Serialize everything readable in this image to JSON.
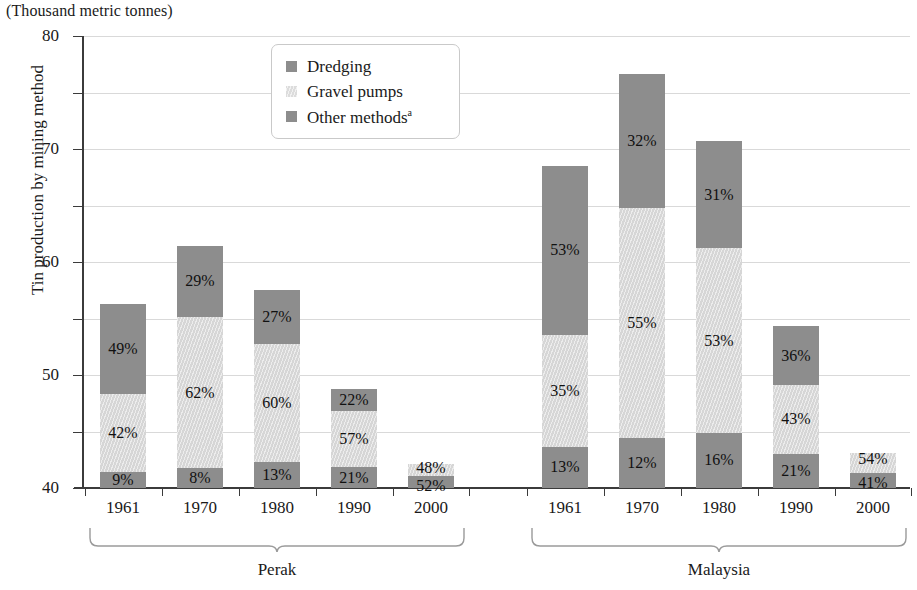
{
  "units_note": "(Thousand metric tonnes)",
  "axis": {
    "y_title": "Tin production by mining method",
    "y_ticks": [
      "0",
      "10",
      "20",
      "30",
      "40",
      "50",
      "60",
      "70",
      "80"
    ]
  },
  "legend": {
    "items": [
      {
        "label": "Dredging",
        "key": "dredging",
        "swatch_icon": "square-swatch-dark",
        "color": "#8d8d8d"
      },
      {
        "label": "Gravel pumps",
        "key": "gravel",
        "swatch_icon": "square-swatch-light-hatched",
        "color": "#dcdcdc"
      },
      {
        "label": "Other methods",
        "label_sup": "a",
        "key": "other",
        "swatch_icon": "square-swatch-medium",
        "color": "#8d8d8d"
      }
    ]
  },
  "groups": [
    {
      "name": "Perak",
      "label": "Perak"
    },
    {
      "name": "Malaysia",
      "label": "Malaysia"
    }
  ],
  "chart_data": {
    "type": "bar",
    "subtype": "stacked",
    "title": "",
    "subtitle": "(Thousand metric tonnes)",
    "xlabel": "",
    "ylabel": "Tin production by mining method",
    "ylim": [
      0,
      80
    ],
    "ytick_step": 10,
    "grid": "horizontal",
    "legend_position": "inside-top-center",
    "footnote_marker": "a",
    "series": [
      {
        "name": "Other methods",
        "key": "other",
        "color": "#8d8d8d",
        "stack_order": 0
      },
      {
        "name": "Gravel pumps",
        "key": "gravel",
        "color": "#dcdcdc",
        "stack_order": 1
      },
      {
        "name": "Dredging",
        "key": "dredging",
        "color": "#8d8d8d",
        "stack_order": 2
      }
    ],
    "groups": [
      {
        "group": "Perak",
        "categories": [
          "1961",
          "1970",
          "1980",
          "1990",
          "2000"
        ],
        "totals": [
          32.5,
          43.3,
          35.0,
          17.5,
          4.2
        ],
        "bars": [
          {
            "x": "1961",
            "total": 32.5,
            "segments": [
              {
                "key": "other",
                "pct": 9,
                "pct_label": "9%",
                "value": 2.9
              },
              {
                "key": "gravel",
                "pct": 42,
                "pct_label": "42%",
                "value": 13.7
              },
              {
                "key": "dredging",
                "pct": 49,
                "pct_label": "49%",
                "value": 15.9
              }
            ]
          },
          {
            "x": "1970",
            "total": 43.3,
            "segments": [
              {
                "key": "other",
                "pct": 8,
                "pct_label": "8%",
                "value": 3.5
              },
              {
                "key": "gravel",
                "pct": 62,
                "pct_label": "62%",
                "value": 26.8
              },
              {
                "key": "dredging",
                "pct": 29,
                "pct_label": "29%",
                "value": 12.6
              }
            ]
          },
          {
            "x": "1980",
            "total": 35.0,
            "segments": [
              {
                "key": "other",
                "pct": 13,
                "pct_label": "13%",
                "value": 4.6
              },
              {
                "key": "gravel",
                "pct": 60,
                "pct_label": "60%",
                "value": 21.0
              },
              {
                "key": "dredging",
                "pct": 27,
                "pct_label": "27%",
                "value": 9.5
              }
            ]
          },
          {
            "x": "1990",
            "total": 17.5,
            "segments": [
              {
                "key": "other",
                "pct": 21,
                "pct_label": "21%",
                "value": 3.7
              },
              {
                "key": "gravel",
                "pct": 57,
                "pct_label": "57%",
                "value": 10.0
              },
              {
                "key": "dredging",
                "pct": 22,
                "pct_label": "22%",
                "value": 3.9
              }
            ]
          },
          {
            "x": "2000",
            "total": 4.2,
            "segments": [
              {
                "key": "other",
                "pct": 52,
                "pct_label": "52%",
                "value": 2.2
              },
              {
                "key": "gravel",
                "pct": 48,
                "pct_label": "48%",
                "value": 2.0
              }
            ]
          }
        ]
      },
      {
        "group": "Malaysia",
        "categories": [
          "1961",
          "1970",
          "1980",
          "1990",
          "2000"
        ],
        "totals": [
          57.0,
          74.0,
          61.5,
          28.7,
          6.5
        ],
        "bars": [
          {
            "x": "1961",
            "total": 57.0,
            "segments": [
              {
                "key": "other",
                "pct": 13,
                "pct_label": "13%",
                "value": 7.4
              },
              {
                "key": "gravel",
                "pct": 35,
                "pct_label": "35%",
                "value": 20.0
              },
              {
                "key": "dredging",
                "pct": 53,
                "pct_label": "53%",
                "value": 30.2
              }
            ]
          },
          {
            "x": "1970",
            "total": 74.0,
            "segments": [
              {
                "key": "other",
                "pct": 12,
                "pct_label": "12%",
                "value": 8.9
              },
              {
                "key": "gravel",
                "pct": 55,
                "pct_label": "55%",
                "value": 40.7
              },
              {
                "key": "dredging",
                "pct": 32,
                "pct_label": "32%",
                "value": 23.7
              }
            ]
          },
          {
            "x": "1980",
            "total": 61.5,
            "segments": [
              {
                "key": "other",
                "pct": 16,
                "pct_label": "16%",
                "value": 9.8
              },
              {
                "key": "gravel",
                "pct": 53,
                "pct_label": "53%",
                "value": 32.6
              },
              {
                "key": "dredging",
                "pct": 31,
                "pct_label": "31%",
                "value": 19.1
              }
            ]
          },
          {
            "x": "1990",
            "total": 28.7,
            "segments": [
              {
                "key": "other",
                "pct": 21,
                "pct_label": "21%",
                "value": 6.0
              },
              {
                "key": "gravel",
                "pct": 43,
                "pct_label": "43%",
                "value": 12.3
              },
              {
                "key": "dredging",
                "pct": 36,
                "pct_label": "36%",
                "value": 10.3
              }
            ]
          },
          {
            "x": "2000",
            "total": 6.5,
            "segments": [
              {
                "key": "other",
                "pct": 41,
                "pct_label": "41%",
                "value": 2.7
              },
              {
                "key": "gravel",
                "pct": 54,
                "pct_label": "54%",
                "value": 3.5
              }
            ]
          }
        ]
      }
    ]
  }
}
